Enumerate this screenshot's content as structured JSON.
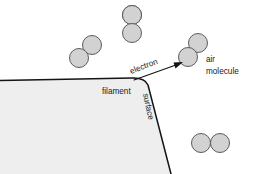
{
  "figure": {
    "background_color": "#ffffff"
  },
  "labels": {
    "electron": "electron",
    "air_line1": "air",
    "air_line2": "molecule",
    "filament": "filament",
    "surface": "surface"
  },
  "colors": {
    "molecule_fill": "#d2d2d2",
    "molecule_stroke": "#5c5c5c",
    "filament_fill": "#eeeeee",
    "filament_stroke": "#141414",
    "arrow": "#141414",
    "text": "#1a1a1a"
  },
  "geometry": {
    "width": 253,
    "height": 174,
    "filament_outline": "M -20,81 L 132,78 Q 145,77.5 148,85 L 171,174",
    "filament_fill_path": "M -20,81 L 132,78 Q 145,77.5 148,85 L 171,174 L -20,174 Z",
    "arrow_start_x": 134,
    "arrow_start_y": 80,
    "arrow_end_x": 182,
    "arrow_end_y": 62.5,
    "electron_label_rotation": -21,
    "surface_label_rotation": 78
  },
  "molecules": [
    {
      "name": "molecule-top-center",
      "orientation": "vertical",
      "atoms": [
        {
          "cx": 132,
          "cy": 15,
          "r": 9.5
        },
        {
          "cx": 132,
          "cy": 33,
          "r": 9.5
        }
      ]
    },
    {
      "name": "molecule-upper-left",
      "orientation": "diagonal",
      "atoms": [
        {
          "cx": 92,
          "cy": 45,
          "r": 9.5
        },
        {
          "cx": 79,
          "cy": 58,
          "r": 9.5
        }
      ]
    },
    {
      "name": "molecule-target-air",
      "orientation": "diagonal",
      "atoms": [
        {
          "cx": 198,
          "cy": 43,
          "r": 9.5
        },
        {
          "cx": 188,
          "cy": 57,
          "r": 9.5
        }
      ]
    },
    {
      "name": "molecule-lower-right",
      "orientation": "horizontal",
      "atoms": [
        {
          "cx": 201,
          "cy": 143,
          "r": 9.5
        },
        {
          "cx": 220,
          "cy": 143,
          "r": 9.5
        }
      ]
    }
  ]
}
